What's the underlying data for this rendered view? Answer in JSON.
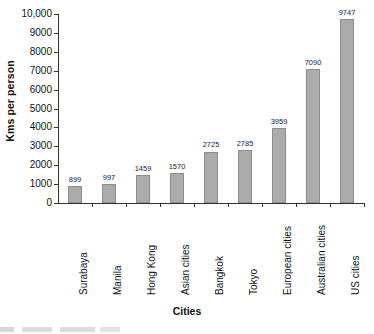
{
  "chart_data": {
    "type": "bar",
    "title": "",
    "xlabel": "Cities",
    "ylabel": "Kms per person",
    "categories": [
      "Surabaya",
      "Manila",
      "Hong Kong",
      "Asian cities",
      "Bangkok",
      "Tokyo",
      "European cities",
      "Australian cities",
      "US cities"
    ],
    "values": [
      899,
      997,
      1459,
      1570,
      2725,
      2785,
      3959,
      7090,
      9747
    ],
    "data_labels": [
      "899",
      "997",
      "1459",
      "1570",
      "2725",
      "2785",
      "3959",
      "7090",
      "9747"
    ],
    "ylim": [
      0,
      10000
    ],
    "ytick_values": [
      0,
      1000,
      2000,
      3000,
      4000,
      5000,
      6000,
      7000,
      8000,
      9000,
      10000
    ],
    "ytick_labels": [
      "0",
      "1000",
      "2000",
      "3000",
      "4000",
      "5000",
      "6000",
      "7000",
      "8000",
      "9000",
      "10,000"
    ],
    "grid": false,
    "legend": "none",
    "bar_color": "#ababab",
    "bar_border_color": "#8d8d8d",
    "axis_color": "#333333",
    "background": "#ffffff"
  },
  "axes": {
    "y_title": "Kms per person",
    "x_title": "Cities"
  }
}
